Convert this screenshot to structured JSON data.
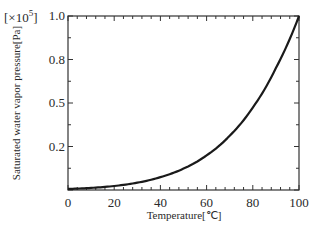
{
  "chart_data": {
    "type": "line",
    "title": "",
    "xlabel": "Temperature[℃]",
    "ylabel": "Saturated water vapor pressure[Pa]",
    "y_multiplier_label": "[×10⁵]",
    "xlim": [
      0,
      100
    ],
    "ylim": [
      0,
      1.0
    ],
    "grid": false,
    "legend": null,
    "x_ticks": [
      0,
      20,
      40,
      60,
      80,
      100
    ],
    "x_tick_labels": [
      "0",
      "20",
      "40",
      "60",
      "80",
      "100"
    ],
    "y_ticks": [
      0,
      0.25,
      0.5,
      0.75,
      1.0
    ],
    "y_tick_labels": [
      "0",
      "0.2",
      "0.5",
      "0.8",
      "1.0"
    ],
    "series": [
      {
        "name": "Saturated water vapor pressure",
        "x": [
          0,
          10,
          20,
          30,
          40,
          50,
          60,
          70,
          80,
          90,
          100
        ],
        "values": [
          0.006,
          0.012,
          0.023,
          0.042,
          0.074,
          0.123,
          0.199,
          0.312,
          0.474,
          0.701,
          1.0
        ]
      }
    ]
  },
  "labels": {
    "multiplier": "[×10",
    "multiplier_exp": "5",
    "multiplier_close": "]",
    "xlabel": "Temperature[℃]",
    "ylabel": "Saturated water vapor pressure[Pa]"
  }
}
